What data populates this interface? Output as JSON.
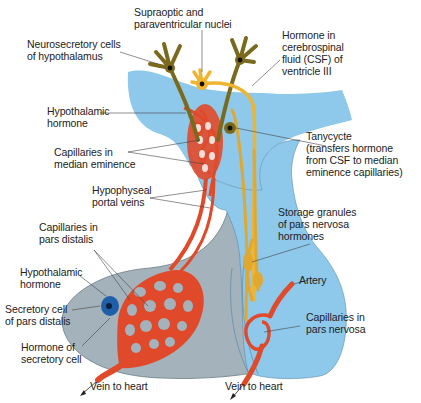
{
  "figure": {
    "colors": {
      "ventricle_csf": "#8ec8ea",
      "pars_distalis": "#a3b2bb",
      "pars_nervosa": "#8ec8ea",
      "blood_vessel": "#e04a2a",
      "neurosecretory_cell": "#7a6a1e",
      "tanycyte": "#e0a830",
      "supraoptic_cell": "#f0b530",
      "secretory_cell": "#1e5fa8"
    }
  },
  "labels": {
    "supraoptic": "Supraoptic and\nparaventricular nuclei",
    "neurosecretory": "Neurosecretory cells\nof hypothalamus",
    "hormone_csf": "Hormone in\ncerebrospinal\nfluid (CSF) of\nventricle III",
    "hypothalamic_hormone_top": "Hypothalamic\nhormone",
    "capillaries_median": "Capillaries in\nmedian eminence",
    "tanycyte": "Tanycycte\n(transfers hormone\nfrom CSF to median\neminence capillaries)",
    "portal_veins": "Hypophyseal\nportal veins",
    "storage_granules": "Storage granules\nof pars nervosa\nhormones",
    "capillaries_distalis": "Capillaries in\npars distalis",
    "hypothalamic_hormone_bottom": "Hypothalamic\nhormone",
    "artery": "Artery",
    "secretory_cell": "Secretory cell\nof pars distalis",
    "capillaries_nervosa": "Capillaries in\npars nervosa",
    "hormone_secretory": "Hormone of\nsecretory cell",
    "vein_left": "Vein to heart",
    "vein_right": "Vein to heart"
  }
}
